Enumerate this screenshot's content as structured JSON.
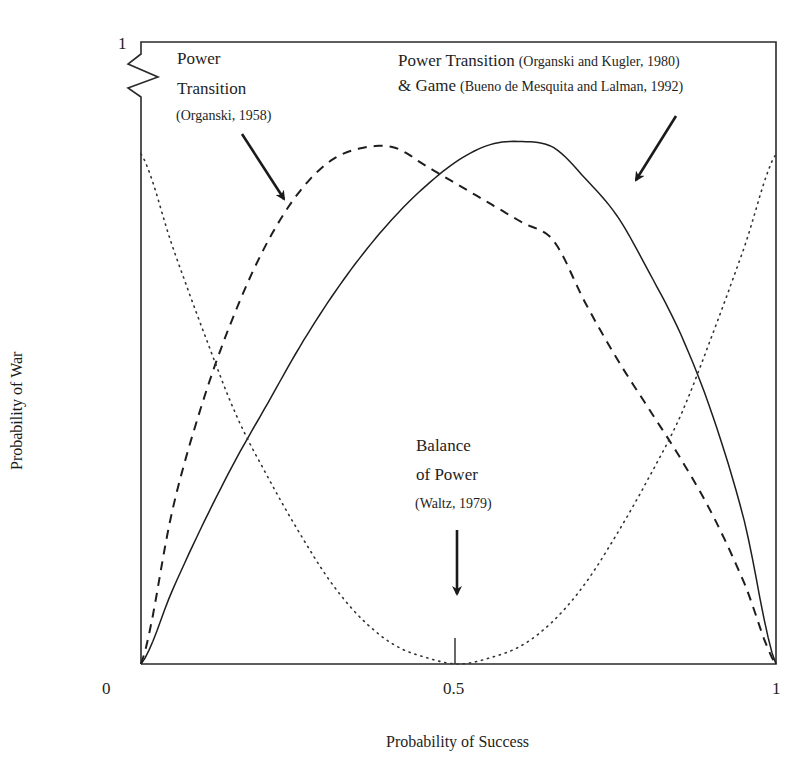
{
  "chart_data": {
    "type": "line",
    "title": "",
    "xlabel": "Probability of Success",
    "ylabel": "Probability of War",
    "xlim": [
      0,
      1
    ],
    "ylim": [
      0,
      1
    ],
    "grid": false,
    "x_ticks": [
      "0",
      "0.5",
      "1"
    ],
    "y_ticks": [
      "1"
    ],
    "x": [
      0,
      0.05,
      0.1,
      0.15,
      0.2,
      0.25,
      0.3,
      0.35,
      0.4,
      0.45,
      0.5,
      0.55,
      0.6,
      0.65,
      0.7,
      0.75,
      0.8,
      0.85,
      0.9,
      0.95,
      1
    ],
    "series": [
      {
        "name": "Power Transition (Organski and Kugler, 1980) & Game (Bueno de Mesquita and Lalman, 1992)",
        "style": "solid",
        "values": [
          0,
          0.12,
          0.23,
          0.33,
          0.42,
          0.51,
          0.59,
          0.66,
          0.72,
          0.77,
          0.81,
          0.835,
          0.84,
          0.83,
          0.78,
          0.72,
          0.63,
          0.53,
          0.4,
          0.23,
          0
        ]
      },
      {
        "name": "Power Transition (Organski, 1958)",
        "style": "dashed",
        "values": [
          0,
          0.25,
          0.43,
          0.57,
          0.68,
          0.76,
          0.81,
          0.83,
          0.83,
          0.8,
          0.77,
          0.74,
          0.71,
          0.68,
          0.58,
          0.49,
          0.41,
          0.33,
          0.24,
          0.13,
          0
        ]
      },
      {
        "name": "Balance of Power (Waltz, 1979)",
        "style": "dotted",
        "values": [
          0.82,
          0.67,
          0.53,
          0.4,
          0.3,
          0.21,
          0.13,
          0.07,
          0.03,
          0.01,
          0,
          0.01,
          0.03,
          0.07,
          0.13,
          0.21,
          0.3,
          0.4,
          0.53,
          0.67,
          0.82
        ]
      }
    ],
    "annotations": [
      {
        "label": "Power Transition (Organski, 1958)",
        "target_series": "dashed"
      },
      {
        "label": "Power Transition (Organski and Kugler, 1980) & Game (Bueno de Mesquita and Lalman, 1992)",
        "target_series": "solid"
      },
      {
        "label": "Balance of Power (Waltz, 1979)",
        "target_x": 0.5
      }
    ]
  },
  "labels": {
    "y_tick_1": "1",
    "x_tick_0": "0",
    "x_tick_05": "0.5",
    "x_tick_1": "1",
    "xlabel": "Probability of Success",
    "ylabel": "Probability of War",
    "ann_left_line1": "Power",
    "ann_left_line2": "Transition",
    "ann_left_cite": "(Organski, 1958)",
    "ann_right_main1": "Power Transition",
    "ann_right_cite1": "(Organski and Kugler, 1980)",
    "ann_right_main2": "& Game",
    "ann_right_cite2": "(Bueno de Mesquita and Lalman, 1992)",
    "ann_bottom_line1": "Balance",
    "ann_bottom_line2": "of Power",
    "ann_bottom_cite": "(Waltz, 1979)"
  }
}
